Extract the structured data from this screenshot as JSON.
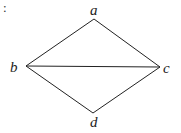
{
  "diagram": {
    "prefix": ":",
    "nodes": [
      {
        "id": "a",
        "label": "a",
        "x": 94,
        "y": 19
      },
      {
        "id": "b",
        "label": "b",
        "x": 26,
        "y": 66
      },
      {
        "id": "c",
        "label": "c",
        "x": 160,
        "y": 67
      },
      {
        "id": "d",
        "label": "d",
        "x": 93,
        "y": 113
      }
    ],
    "edges": [
      {
        "from": "a",
        "to": "b"
      },
      {
        "from": "a",
        "to": "c"
      },
      {
        "from": "b",
        "to": "c"
      },
      {
        "from": "b",
        "to": "d"
      },
      {
        "from": "c",
        "to": "d"
      }
    ]
  }
}
